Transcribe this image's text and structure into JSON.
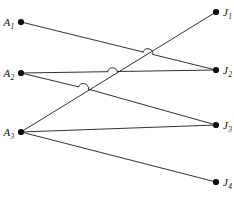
{
  "figure": {
    "type": "bipartite-assignment-graph",
    "width": 234,
    "height": 200,
    "background_color": "#ffffff",
    "line_color": "#1a1a1a",
    "node_color": "#0d0d0d",
    "node_radius": 3.1,
    "line_width": 0.9
  },
  "left_nodes": [
    {
      "id": "A1",
      "label": "A",
      "sub": "1",
      "x": 21,
      "y": 22
    },
    {
      "id": "A2",
      "label": "A",
      "sub": "2",
      "x": 21,
      "y": 73
    },
    {
      "id": "A3",
      "label": "A",
      "sub": "3",
      "x": 21,
      "y": 132
    }
  ],
  "right_nodes": [
    {
      "id": "J1",
      "label": "J",
      "sub": "1",
      "x": 216,
      "y": 12
    },
    {
      "id": "J2",
      "label": "J",
      "sub": "2",
      "x": 216,
      "y": 70
    },
    {
      "id": "J3",
      "label": "J",
      "sub": "3",
      "x": 216,
      "y": 125
    },
    {
      "id": "J4",
      "label": "J",
      "sub": "4",
      "x": 216,
      "y": 182
    }
  ],
  "edges": [
    {
      "id": "A1-J2",
      "from": "A1",
      "to": "J2",
      "x1": 21,
      "y1": 22,
      "x2": 216,
      "y2": 70
    },
    {
      "id": "A2-J2",
      "from": "A2",
      "to": "J2",
      "x1": 21,
      "y1": 73,
      "x2": 216,
      "y2": 70
    },
    {
      "id": "A2-J3",
      "from": "A2",
      "to": "J3",
      "x1": 21,
      "y1": 73,
      "x2": 216,
      "y2": 125
    },
    {
      "id": "A3-J1",
      "from": "A3",
      "to": "J1",
      "x1": 21,
      "y1": 132,
      "x2": 216,
      "y2": 12
    },
    {
      "id": "A3-J3",
      "from": "A3",
      "to": "J3",
      "x1": 21,
      "y1": 132,
      "x2": 216,
      "y2": 125
    },
    {
      "id": "A3-J4",
      "from": "A3",
      "to": "J4",
      "x1": 21,
      "y1": 132,
      "x2": 216,
      "y2": 182
    }
  ],
  "crossing_hops": [
    {
      "id": "hop-A1J2-over-A3J1",
      "on_edge": "A1-J2",
      "crosses": "A3-J1",
      "cx": 147,
      "cy": 53,
      "r": 5.2
    },
    {
      "id": "hop-A2J2-over-A3J1",
      "on_edge": "A2-J2",
      "crosses": "A3-J1",
      "cx": 112,
      "cy": 71,
      "r": 5.2
    },
    {
      "id": "hop-A2J3-over-A3J1",
      "on_edge": "A2-J3",
      "crosses": "A3-J1",
      "cx": 83,
      "cy": 88,
      "r": 5.2
    }
  ]
}
